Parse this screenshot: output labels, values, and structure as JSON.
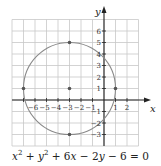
{
  "figure": {
    "equation": "x² + y² + 6x − 2y − 6 = 0",
    "axis_x_label": "x",
    "axis_y_label": "y",
    "x_tick_labels": [
      "−6",
      "−5",
      "−4",
      "−3",
      "−2",
      "−1",
      "1",
      "2"
    ],
    "y_tick_labels": [
      "6",
      "5",
      "4",
      "3",
      "2",
      "1",
      "−1",
      "−2",
      "−3"
    ],
    "circle": {
      "center": [
        -3,
        1
      ],
      "radius": 4
    },
    "marked_points": [
      [
        -3,
        1
      ],
      [
        -3,
        5
      ],
      [
        -3,
        -3
      ],
      [
        -7,
        1
      ],
      [
        1,
        1
      ]
    ],
    "grid": {
      "x_range": [
        -8,
        3
      ],
      "y_range": [
        -4,
        7
      ]
    },
    "colors": {
      "circle": "#8a8a8a",
      "grid": "#c8c8c8",
      "axis": "#222222"
    }
  }
}
